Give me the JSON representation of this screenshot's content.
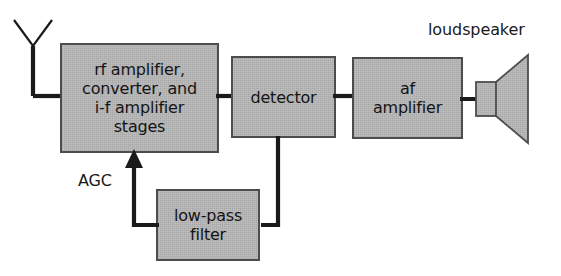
{
  "diagram": {
    "background_color": "#ffffff",
    "block_fill_color": "#b3b3b3",
    "block_stroke_color": "#4d4d4d",
    "line_color": "#1a1a1a",
    "text_color": "#141414",
    "blocks": [
      {
        "id": "rf-stages",
        "label": "rf amplifier,\nconverter, and\ni-f amplifier\nstages",
        "x": 61,
        "y": 44,
        "width": 157,
        "height": 108
      },
      {
        "id": "detector",
        "label": "detector",
        "x": 232,
        "y": 57,
        "width": 103,
        "height": 80
      },
      {
        "id": "af-amplifier",
        "label": "af\namplifier",
        "x": 353,
        "y": 58,
        "width": 109,
        "height": 80
      },
      {
        "id": "low-pass-filter",
        "label": "low-pass\nfilter",
        "x": 157,
        "y": 190,
        "width": 102,
        "height": 70
      }
    ],
    "free_labels": [
      {
        "id": "agc",
        "text": "AGC",
        "x": 78,
        "y": 171
      },
      {
        "id": "loudspeaker",
        "text": "loudspeaker",
        "x": 428,
        "y": 20
      }
    ],
    "symbols": [
      {
        "id": "antenna",
        "type": "dipole-antenna"
      },
      {
        "id": "loudspeaker",
        "type": "speaker-cone"
      }
    ],
    "connections": [
      {
        "from": "antenna",
        "to": "rf-stages"
      },
      {
        "from": "rf-stages",
        "to": "detector"
      },
      {
        "from": "detector",
        "to": "af-amplifier"
      },
      {
        "from": "af-amplifier",
        "to": "loudspeaker"
      },
      {
        "from": "detector",
        "to": "low-pass-filter"
      },
      {
        "from": "low-pass-filter",
        "to": "rf-stages",
        "arrow": true,
        "label": "AGC"
      }
    ]
  }
}
